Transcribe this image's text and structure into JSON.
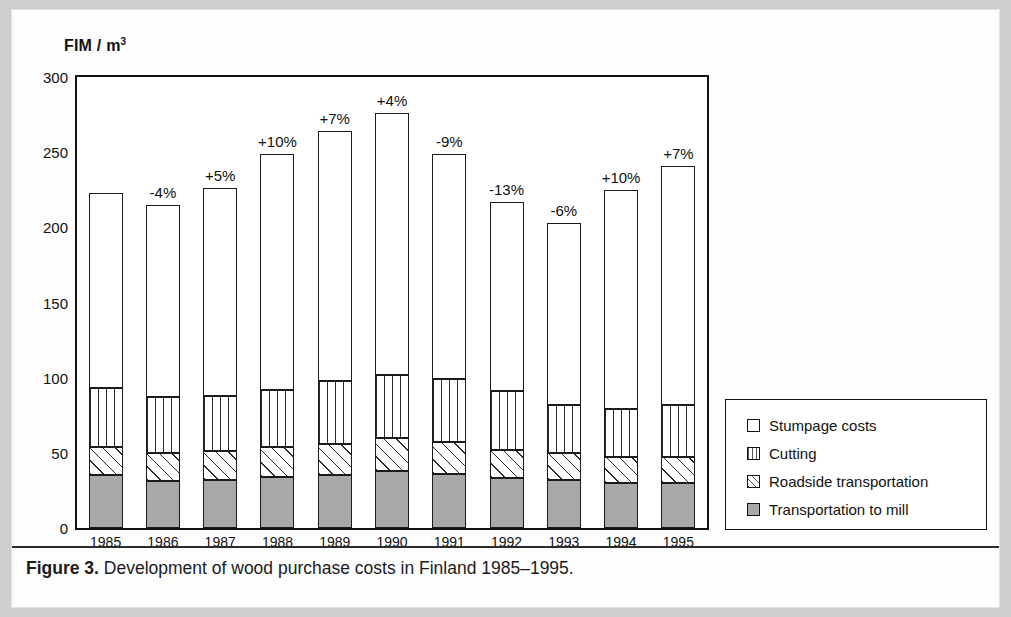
{
  "caption": {
    "figure_number": "Figure 3.",
    "text": "Development of wood purchase costs in Finland 1985–1995."
  },
  "legend": {
    "items": [
      {
        "label": "Stumpage costs",
        "key": "stumpage",
        "pattern": "white",
        "color": "#ffffff"
      },
      {
        "label": "Cutting",
        "key": "cutting",
        "pattern": "vertical-lines",
        "color": "#ffffff"
      },
      {
        "label": "Roadside transportation",
        "key": "roadside",
        "pattern": "diagonal-hatch",
        "color": "#ffffff"
      },
      {
        "label": "Transportation to mill",
        "key": "mill",
        "pattern": "solid-gray",
        "color": "#a8a8a8"
      }
    ]
  },
  "chart_data": {
    "type": "bar",
    "subtype": "stacked-column",
    "title": "",
    "xlabel": "",
    "ylabel": "FIM / m3",
    "ylabel_rich": {
      "prefix": "FIM",
      "separator": "/",
      "unit": "m",
      "exponent": "3"
    },
    "ylim": [
      0,
      300
    ],
    "yticks": [
      0,
      50,
      100,
      150,
      200,
      250,
      300
    ],
    "grid": false,
    "legend_position": "right",
    "categories": [
      "1985",
      "1986",
      "1987",
      "1988",
      "1989",
      "1990",
      "1991",
      "1992",
      "1993",
      "1994",
      "1995"
    ],
    "series": [
      {
        "name": "Transportation to mill",
        "key": "mill",
        "values": [
          35,
          31,
          32,
          34,
          35,
          38,
          36,
          33,
          32,
          30,
          30
        ]
      },
      {
        "name": "Roadside transportation",
        "key": "roadside",
        "values": [
          19,
          19,
          19,
          20,
          21,
          22,
          21,
          19,
          18,
          17,
          17
        ]
      },
      {
        "name": "Cutting",
        "key": "cutting",
        "values": [
          39,
          37,
          37,
          38,
          42,
          42,
          42,
          39,
          32,
          32,
          35
        ]
      },
      {
        "name": "Stumpage costs",
        "key": "stumpage",
        "values": [
          130,
          128,
          138,
          157,
          166,
          174,
          150,
          126,
          121,
          146,
          159
        ]
      }
    ],
    "totals": [
      223,
      215,
      226,
      249,
      264,
      276,
      249,
      217,
      203,
      225,
      241
    ],
    "change_labels": [
      "",
      "-4%",
      "+5%",
      "+10%",
      "+7%",
      "+4%",
      "-9%",
      "-13%",
      "-6%",
      "+10%",
      "+7%"
    ]
  }
}
